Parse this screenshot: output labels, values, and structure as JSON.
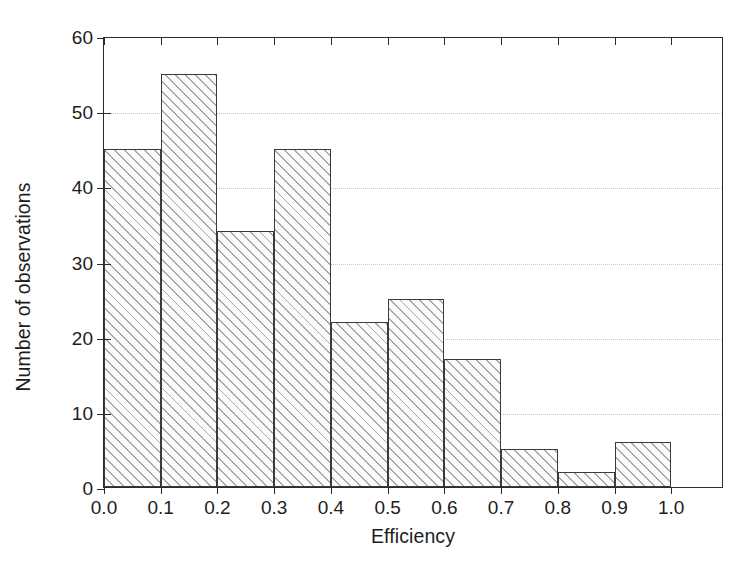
{
  "chart_data": {
    "type": "bar",
    "title": "",
    "subtitle": "",
    "xlabel": "Efficiency",
    "ylabel": "Number of observations",
    "categories": [
      "0.0-0.1",
      "0.1-0.2",
      "0.2-0.3",
      "0.3-0.4",
      "0.4-0.5",
      "0.5-0.6",
      "0.6-0.7",
      "0.7-0.8",
      "0.8-0.9",
      "0.9-1.0"
    ],
    "bin_edges": [
      0.0,
      0.1,
      0.2,
      0.3,
      0.4,
      0.5,
      0.6,
      0.7,
      0.8,
      0.9,
      1.0
    ],
    "values": [
      45,
      55,
      34,
      45,
      22,
      25,
      17,
      5,
      2,
      6
    ],
    "bin_width": 0.1,
    "xlim": [
      0.0,
      1.093
    ],
    "ylim": [
      0,
      60
    ],
    "xticks": [
      0.0,
      0.1,
      0.2,
      0.3,
      0.4,
      0.5,
      0.6,
      0.7,
      0.8,
      0.9,
      1.0
    ],
    "xtick_labels": [
      "0.0",
      "0.1",
      "0.2",
      "0.3",
      "0.4",
      "0.5",
      "0.6",
      "0.7",
      "0.8",
      "0.9",
      "1.0"
    ],
    "yticks": [
      0,
      10,
      20,
      30,
      40,
      50,
      60
    ],
    "ytick_labels": [
      "0",
      "10",
      "20",
      "30",
      "40",
      "50",
      "60"
    ],
    "gridlines_y": [
      10,
      20,
      30,
      40,
      50
    ],
    "grid": "horizontal-dotted",
    "legend": "none",
    "bar_fill": "#fbfbfb",
    "bar_hatch": "diagonal-45",
    "bar_hatch_color": "#a9a9a9",
    "bar_edge_color": "#3b3b3b",
    "axis_color": "#2b2b2b",
    "grid_color": "#c9c9c9",
    "background": "#ffffff",
    "total_observations": 256
  }
}
